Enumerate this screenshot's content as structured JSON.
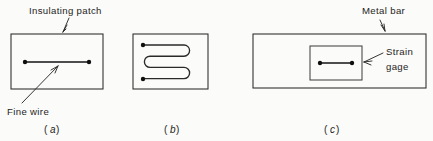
{
  "figure": {
    "background_color": "#fbfbf9",
    "ink_color": "#1d1d1d"
  },
  "panels": [
    {
      "id": "a",
      "caption_open": "(",
      "caption_letter": "a",
      "caption_close": ")",
      "labels": [
        {
          "name": "insulating-patch",
          "text": "Insulating patch"
        },
        {
          "name": "fine-wire",
          "text": "Fine wire"
        }
      ],
      "elements": {
        "patch_rect": {
          "x": 11,
          "y": 34,
          "width": 92,
          "height": 55
        },
        "wire": {
          "x1": 25,
          "y1": 62,
          "x2": 89,
          "y2": 62
        },
        "terminals": [
          {
            "cx": 25,
            "cy": 62,
            "r": 2.2
          },
          {
            "cx": 89,
            "cy": 62,
            "r": 2.2
          }
        ]
      }
    },
    {
      "id": "b",
      "caption_open": "(",
      "caption_letter": "b",
      "caption_close": ")",
      "labels": [],
      "elements": {
        "patch_rect": {
          "x": 133,
          "y": 34,
          "width": 75,
          "height": 55
        },
        "serpentine_passes": 4,
        "terminals": [
          {
            "cx": 143,
            "cy": 45,
            "r": 2.2
          },
          {
            "cx": 143,
            "cy": 79,
            "r": 2.2
          }
        ]
      }
    },
    {
      "id": "c",
      "caption_open": "(",
      "caption_letter": "c",
      "caption_close": ")",
      "labels": [
        {
          "name": "metal-bar",
          "text": "Metal bar"
        },
        {
          "name": "strain-gage-line1",
          "text": "Strain"
        },
        {
          "name": "strain-gage-line2",
          "text": "gage"
        }
      ],
      "elements": {
        "bar_rect": {
          "x": 253,
          "y": 34,
          "width": 173,
          "height": 54
        },
        "gage_rect": {
          "x": 310,
          "y": 46,
          "width": 52,
          "height": 34
        },
        "wire": {
          "x1": 320,
          "y1": 63,
          "x2": 352,
          "y2": 63
        },
        "terminals": [
          {
            "cx": 320,
            "cy": 63,
            "r": 2.2
          },
          {
            "cx": 352,
            "cy": 63,
            "r": 2.2
          }
        ]
      }
    }
  ]
}
